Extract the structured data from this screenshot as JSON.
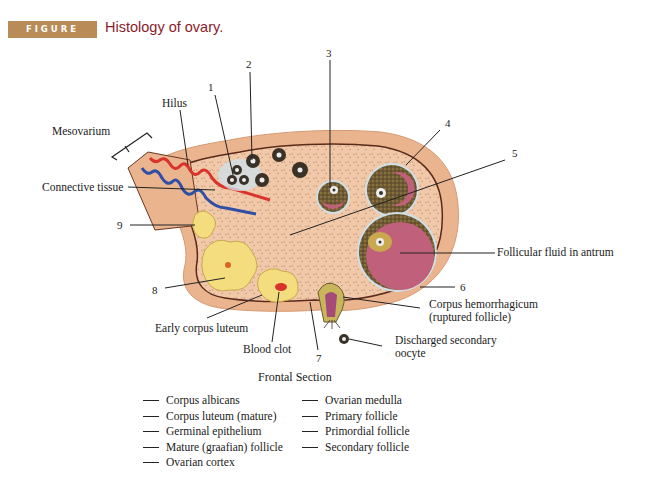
{
  "header": {
    "figure_label": "FIGURE 15.7",
    "title": "Histology of ovary.",
    "badge_color": "#b98c57",
    "title_color": "#8a1c2c"
  },
  "labels": {
    "mesovarium": "Mesovarium",
    "hilus": "Hilus",
    "connective_tissue": "Connective tissue",
    "follicular_fluid": "Follicular fluid in antrum",
    "corpus_hemorrhagicum_1": "Corpus hemorrhagicum",
    "corpus_hemorrhagicum_2": "(ruptured follicle)",
    "discharged_oocyte_1": "Discharged secondary",
    "discharged_oocyte_2": "oocyte",
    "early_corpus_luteum": "Early corpus luteum",
    "blood_clot": "Blood clot"
  },
  "numbers": {
    "n1": "1",
    "n2": "2",
    "n3": "3",
    "n4": "4",
    "n5": "5",
    "n6": "6",
    "n7": "7",
    "n8": "8",
    "n9": "9"
  },
  "caption": "Frontal Section",
  "checklist": {
    "left": [
      "Corpus albicans",
      "Corpus luteum (mature)",
      "Germinal epithelium",
      "Mature (graafian) follicle",
      "Ovarian cortex"
    ],
    "right": [
      "Ovarian medulla",
      "Primary follicle",
      "Primordial follicle",
      "Secondary follicle"
    ]
  },
  "colors": {
    "ovary_fill": "#f2c9a8",
    "ovary_edge": "#e5b08a",
    "antrum": "#c0607a",
    "corpus_luteum": "#f3dd7e",
    "artery": "#d8342c",
    "vein": "#2f4fa6"
  }
}
